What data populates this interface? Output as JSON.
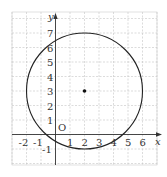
{
  "diagram": {
    "type": "coordinate-plane-circle",
    "axes": {
      "x_label": "x",
      "y_label": "y",
      "origin_label": "O"
    },
    "x_ticks": [
      "-2",
      "-1",
      "1",
      "2",
      "3",
      "4",
      "5",
      "6"
    ],
    "y_ticks": [
      "-1",
      "1",
      "2",
      "3",
      "4",
      "5",
      "6",
      "7"
    ],
    "grid": {
      "x_range": [
        -3,
        7
      ],
      "y_range": [
        -2,
        8
      ],
      "style": "dashed"
    },
    "circle": {
      "center": [
        2,
        3
      ],
      "radius": 4
    },
    "center_point": [
      2,
      3
    ],
    "colors": {
      "grid": "#bbbbbb",
      "stroke": "#222222"
    }
  }
}
